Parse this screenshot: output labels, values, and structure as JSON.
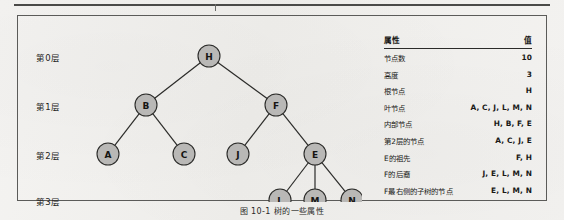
{
  "figure": {
    "caption": "图 10-1  树的一些属性",
    "levels": [
      {
        "label": "第0层"
      },
      {
        "label": "第1层"
      },
      {
        "label": "第2层"
      },
      {
        "label": "第3层"
      }
    ],
    "tree": {
      "nodes": [
        {
          "id": "H",
          "label": "H",
          "cx": 191,
          "cy": 40,
          "level": 0
        },
        {
          "id": "B",
          "label": "B",
          "cx": 128,
          "cy": 89,
          "level": 1
        },
        {
          "id": "F",
          "label": "F",
          "cx": 258,
          "cy": 89,
          "level": 1
        },
        {
          "id": "A",
          "label": "A",
          "cx": 90,
          "cy": 138,
          "level": 2
        },
        {
          "id": "C",
          "label": "C",
          "cx": 166,
          "cy": 138,
          "level": 2
        },
        {
          "id": "J",
          "label": "J",
          "cx": 220,
          "cy": 138,
          "level": 2
        },
        {
          "id": "E",
          "label": "E",
          "cx": 297,
          "cy": 138,
          "level": 2
        },
        {
          "id": "L",
          "label": "L",
          "cx": 262,
          "cy": 184,
          "level": 3
        },
        {
          "id": "M",
          "label": "M",
          "cx": 297,
          "cy": 184,
          "level": 3
        },
        {
          "id": "N",
          "label": "N",
          "cx": 334,
          "cy": 184,
          "level": 3
        }
      ],
      "edges": [
        {
          "from": "H",
          "to": "B"
        },
        {
          "from": "H",
          "to": "F"
        },
        {
          "from": "B",
          "to": "A"
        },
        {
          "from": "B",
          "to": "C"
        },
        {
          "from": "F",
          "to": "J"
        },
        {
          "from": "F",
          "to": "E"
        },
        {
          "from": "E",
          "to": "L"
        },
        {
          "from": "E",
          "to": "M"
        },
        {
          "from": "E",
          "to": "N"
        }
      ],
      "node_radius": 11,
      "node_fill": "#b9b8b6",
      "node_stroke": "#2b2b29"
    }
  },
  "table": {
    "headers": {
      "attribute": "属性",
      "value": "值"
    },
    "rows": [
      {
        "attribute": "节点数",
        "value": "10"
      },
      {
        "attribute": "高度",
        "value": "3"
      },
      {
        "attribute": "根节点",
        "value": "H"
      },
      {
        "attribute": "叶节点",
        "value": "A, C, J, L, M, N"
      },
      {
        "attribute": "内部节点",
        "value": "H, B, F, E"
      },
      {
        "attribute": "第2层的节点",
        "value": "A, C, J, E"
      },
      {
        "attribute": "E的祖先",
        "value": "F, H"
      },
      {
        "attribute": "F的后裔",
        "value": "J, E, L, M, N"
      },
      {
        "attribute": "F最右侧的子树的节点",
        "value": "E, L, M, N"
      }
    ]
  }
}
